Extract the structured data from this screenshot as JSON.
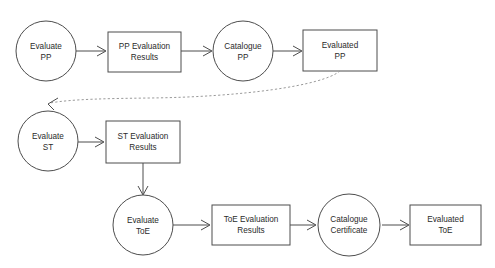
{
  "diagram": {
    "background_color": "#ffffff",
    "shape_stroke_color": "#4d4d4d",
    "dashed_edge_color": "#9a9a9a",
    "text_color": "#2b2b2b",
    "nodes": [
      {
        "id": "evaluate-pp",
        "shape": "circle",
        "line1": "Evaluate",
        "line2": "PP"
      },
      {
        "id": "pp-evaluation-results",
        "shape": "rectangle",
        "line1": "PP Evaluation",
        "line2": "Results"
      },
      {
        "id": "catalogue-pp",
        "shape": "circle",
        "line1": "Catalogue",
        "line2": "PP"
      },
      {
        "id": "evaluated-pp",
        "shape": "rectangle",
        "line1": "Evaluated",
        "line2": "PP"
      },
      {
        "id": "evaluate-st",
        "shape": "circle",
        "line1": "Evaluate",
        "line2": "ST"
      },
      {
        "id": "st-evaluation-results",
        "shape": "rectangle",
        "line1": "ST Evaluation",
        "line2": "Results"
      },
      {
        "id": "evaluate-toe",
        "shape": "circle",
        "line1": "Evaluate",
        "line2": "ToE"
      },
      {
        "id": "toe-evaluation-results",
        "shape": "rectangle",
        "line1": "ToE Evaluation",
        "line2": "Results"
      },
      {
        "id": "catalogue-certificate",
        "shape": "circle",
        "line1": "Catalogue",
        "line2": "Certificate"
      },
      {
        "id": "evaluated-toe",
        "shape": "rectangle",
        "line1": "Evaluated",
        "line2": "ToE"
      }
    ],
    "edges": [
      {
        "id": "edge-evaluate-pp-to-results",
        "from": "evaluate-pp",
        "to": "pp-evaluation-results",
        "style": "solid"
      },
      {
        "id": "edge-results-to-catalogue-pp",
        "from": "pp-evaluation-results",
        "to": "catalogue-pp",
        "style": "solid"
      },
      {
        "id": "edge-catalogue-pp-to-evaluated",
        "from": "catalogue-pp",
        "to": "evaluated-pp",
        "style": "solid"
      },
      {
        "id": "edge-evaluated-pp-to-evaluate-st",
        "from": "evaluated-pp",
        "to": "evaluate-st",
        "style": "dashed"
      },
      {
        "id": "edge-evaluate-st-to-results",
        "from": "evaluate-st",
        "to": "st-evaluation-results",
        "style": "solid"
      },
      {
        "id": "edge-st-results-to-evaluate-toe",
        "from": "st-evaluation-results",
        "to": "evaluate-toe",
        "style": "solid"
      },
      {
        "id": "edge-evaluate-toe-to-results",
        "from": "evaluate-toe",
        "to": "toe-evaluation-results",
        "style": "solid"
      },
      {
        "id": "edge-toe-results-to-catalogue",
        "from": "toe-evaluation-results",
        "to": "catalogue-certificate",
        "style": "solid"
      },
      {
        "id": "edge-catalogue-to-evaluated-toe",
        "from": "catalogue-certificate",
        "to": "evaluated-toe",
        "style": "solid"
      }
    ]
  }
}
